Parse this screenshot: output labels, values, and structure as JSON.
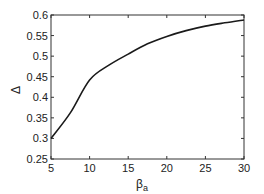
{
  "chart_data": {
    "type": "line",
    "title": "",
    "xlabel": "βa",
    "xlabel_main": "β",
    "xlabel_sub": "a",
    "ylabel": "Δ",
    "xlim": [
      5,
      30
    ],
    "ylim": [
      0.25,
      0.6
    ],
    "xticks": [
      5,
      10,
      15,
      20,
      25,
      30
    ],
    "yticks": [
      0.25,
      0.3,
      0.35,
      0.4,
      0.45,
      0.5,
      0.55,
      0.6
    ],
    "xtick_labels": [
      "5",
      "10",
      "15",
      "20",
      "25",
      "30"
    ],
    "ytick_labels": [
      "0.25",
      "0.3",
      "0.35",
      "0.4",
      "0.45",
      "0.5",
      "0.55",
      "0.6"
    ],
    "grid": false,
    "legend": null,
    "series": [
      {
        "name": "Δ",
        "color": "#1a1a1a",
        "x": [
          5,
          7.5,
          10,
          12.5,
          15,
          17.5,
          20,
          22.5,
          25,
          27.5,
          30
        ],
        "y": [
          0.3,
          0.362,
          0.442,
          0.478,
          0.505,
          0.53,
          0.548,
          0.562,
          0.573,
          0.581,
          0.588
        ]
      }
    ]
  }
}
